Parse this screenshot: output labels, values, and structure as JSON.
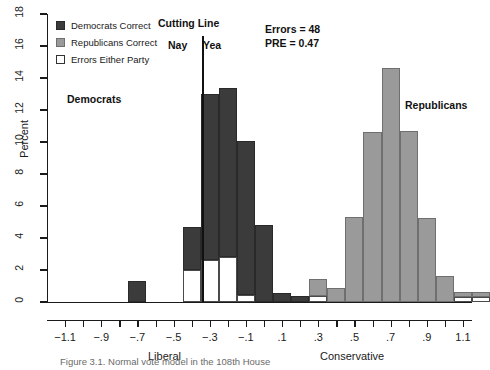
{
  "chart_data": {
    "type": "bar",
    "title": "",
    "xlabel": "",
    "ylabel": "Percent",
    "ylim": [
      0,
      18
    ],
    "xlim": [
      -1.2,
      1.15
    ],
    "grid": false,
    "legend_position": "top-left",
    "y_ticks": [
      0,
      2,
      4,
      6,
      8,
      10,
      12,
      14,
      16,
      18
    ],
    "y_tick_labels": [
      "0",
      "2",
      "4",
      "6",
      "8",
      "10",
      "12",
      "14",
      "16",
      "18"
    ],
    "x_ticks": [
      -1.1,
      -1.0,
      -0.9,
      -0.8,
      -0.7,
      -0.6,
      -0.5,
      -0.4,
      -0.3,
      -0.2,
      -0.1,
      0.0,
      0.1,
      0.2,
      0.3,
      0.4,
      0.5,
      0.6,
      0.7,
      0.8,
      0.9,
      1.0,
      1.1
    ],
    "x_tick_labels": [
      "−1.1",
      "",
      "−.9",
      "",
      "−.7",
      "",
      "−.5",
      "",
      "−.3",
      "",
      "−.1",
      "",
      ".1",
      "",
      ".3",
      "",
      ".5",
      "",
      ".7",
      "",
      ".9",
      "",
      "1.1"
    ],
    "bin_width": 0.1,
    "series": [
      {
        "name": "Democrats Correct",
        "color": "#3b3b3b"
      },
      {
        "name": "Republicans Correct",
        "color": "#9a9a9a"
      },
      {
        "name": "Errors Either Party",
        "color": "#ffffff"
      }
    ],
    "bins": [
      {
        "x0": -0.75,
        "correct": 1.3,
        "correct_party": "dem",
        "errors": 0.0
      },
      {
        "x0": -0.65,
        "correct": 0.0,
        "correct_party": "dem",
        "errors": 0.0
      },
      {
        "x0": -0.55,
        "correct": 0.0,
        "correct_party": "dem",
        "errors": 0.0
      },
      {
        "x0": -0.45,
        "correct": 2.7,
        "correct_party": "dem",
        "errors": 2.0
      },
      {
        "x0": -0.35,
        "correct": 10.4,
        "correct_party": "dem",
        "errors": 2.6
      },
      {
        "x0": -0.25,
        "correct": 10.6,
        "correct_party": "dem",
        "errors": 2.8
      },
      {
        "x0": -0.15,
        "correct": 9.6,
        "correct_party": "dem",
        "errors": 0.45
      },
      {
        "x0": -0.05,
        "correct": 4.8,
        "correct_party": "dem",
        "errors": 0.0
      },
      {
        "x0": 0.05,
        "correct": 0.55,
        "correct_party": "dem",
        "errors": 0.0
      },
      {
        "x0": 0.15,
        "correct": 0.35,
        "correct_party": "dem",
        "errors": 0.0
      },
      {
        "x0": 0.25,
        "correct": 1.05,
        "correct_party": "rep",
        "errors": 0.4
      },
      {
        "x0": 0.35,
        "correct": 0.9,
        "correct_party": "rep",
        "errors": 0.0
      },
      {
        "x0": 0.45,
        "correct": 5.3,
        "correct_party": "rep",
        "errors": 0.0
      },
      {
        "x0": 0.55,
        "correct": 10.6,
        "correct_party": "rep",
        "errors": 0.0
      },
      {
        "x0": 0.65,
        "correct": 14.6,
        "correct_party": "rep",
        "errors": 0.0
      },
      {
        "x0": 0.75,
        "correct": 10.7,
        "correct_party": "rep",
        "errors": 0.0
      },
      {
        "x0": 0.85,
        "correct": 5.25,
        "correct_party": "rep",
        "errors": 0.0
      },
      {
        "x0": 0.95,
        "correct": 1.6,
        "correct_party": "rep",
        "errors": 0.0
      },
      {
        "x0": 1.05,
        "correct": 0.3,
        "correct_party": "rep",
        "errors": 0.3
      },
      {
        "x0": 1.15,
        "correct": 0.3,
        "correct_party": "rep",
        "errors": 0.3
      }
    ],
    "cutting_line": {
      "x": -0.34,
      "label": "Cutting Line",
      "left_label": "Nay",
      "right_label": "Yea"
    },
    "annotations": [
      {
        "id": "errors",
        "text": "Errors = 48"
      },
      {
        "id": "pre",
        "text": "PRE = 0.47"
      },
      {
        "id": "democrats",
        "text": "Democrats"
      },
      {
        "id": "republicans",
        "text": "Republicans"
      },
      {
        "id": "liberal",
        "text": "Liberal"
      },
      {
        "id": "conservative",
        "text": "Conservative"
      }
    ]
  },
  "legend": {
    "items": [
      {
        "label": "Democrats Correct",
        "swatch": "dem"
      },
      {
        "label": "Republicans Correct",
        "swatch": "rep"
      },
      {
        "label": "Errors Either Party",
        "swatch": "err"
      }
    ]
  },
  "axis": {
    "y_title": "Percent"
  },
  "labels": {
    "cutting_line": "Cutting Line",
    "nay": "Nay",
    "yea": "Yea",
    "errors": "Errors = 48",
    "pre": "PRE = 0.47",
    "democrats": "Democrats",
    "republicans": "Republicans",
    "liberal": "Liberal",
    "conservative": "Conservative"
  },
  "caption": "Figure 3.1. Normal vote model in the 108th House"
}
